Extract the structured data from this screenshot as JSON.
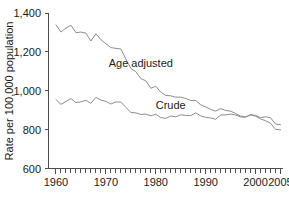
{
  "chart_data": {
    "type": "line",
    "title": "",
    "xlabel": "",
    "ylabel": "Rate per 100,000 population",
    "xlim": [
      1958.5,
      2005.5
    ],
    "ylim": [
      600,
      1400
    ],
    "grid": false,
    "legend_position": "inline-annotation",
    "y_ticks": [
      600,
      800,
      1000,
      1200,
      1400
    ],
    "y_tick_labels": [
      "600",
      "800",
      "1,000",
      "1,200",
      "1,400"
    ],
    "x_ticks": [
      1960,
      1970,
      1980,
      1990,
      2000,
      2005
    ],
    "x_tick_labels": [
      "1960",
      "1970",
      "1980",
      "1990",
      "2000",
      "2005"
    ],
    "x_minor_tick_interval": 1,
    "x": [
      1960,
      1961,
      1962,
      1963,
      1964,
      1965,
      1966,
      1967,
      1968,
      1969,
      1970,
      1971,
      1972,
      1973,
      1974,
      1975,
      1976,
      1977,
      1978,
      1979,
      1980,
      1981,
      1982,
      1983,
      1984,
      1985,
      1986,
      1987,
      1988,
      1989,
      1990,
      1991,
      1992,
      1993,
      1994,
      1995,
      1996,
      1997,
      1998,
      1999,
      2000,
      2001,
      2002,
      2003,
      2004,
      2005
    ],
    "series": [
      {
        "name": "Age adjusted",
        "annotation": "Age adjusted",
        "color": "#8c8c8c",
        "values": [
          1339,
          1302,
          1323,
          1337,
          1299,
          1302,
          1296,
          1256,
          1293,
          1263,
          1242,
          1222,
          1218,
          1215,
          1163,
          1115,
          1098,
          1063,
          1051,
          1013,
          1023,
          993,
          976,
          974,
          967,
          967,
          960,
          950,
          949,
          928,
          917,
          904,
          895,
          908,
          899,
          895,
          883,
          870,
          866,
          876,
          869,
          855,
          846,
          833,
          801,
          799
        ]
      },
      {
        "name": "Crude",
        "annotation": "Crude",
        "color": "#8c8c8c",
        "values": [
          954,
          930,
          945,
          960,
          939,
          943,
          951,
          935,
          966,
          952,
          945,
          932,
          942,
          942,
          915,
          888,
          886,
          878,
          880,
          871,
          879,
          862,
          858,
          870,
          866,
          876,
          873,
          872,
          886,
          871,
          863,
          860,
          853,
          875,
          876,
          880,
          875,
          865,
          864,
          877,
          873,
          862,
          866,
          861,
          829,
          825
        ]
      }
    ],
    "annotations": [
      {
        "text": "Age adjusted",
        "x": 1977,
        "y": 1120
      },
      {
        "text": "Crude",
        "x": 1983,
        "y": 905
      }
    ]
  },
  "colors": {
    "background": "#ffffff",
    "axis": "#4d4d4d",
    "text": "#1a1a1a",
    "line": "#8c8c8c"
  }
}
